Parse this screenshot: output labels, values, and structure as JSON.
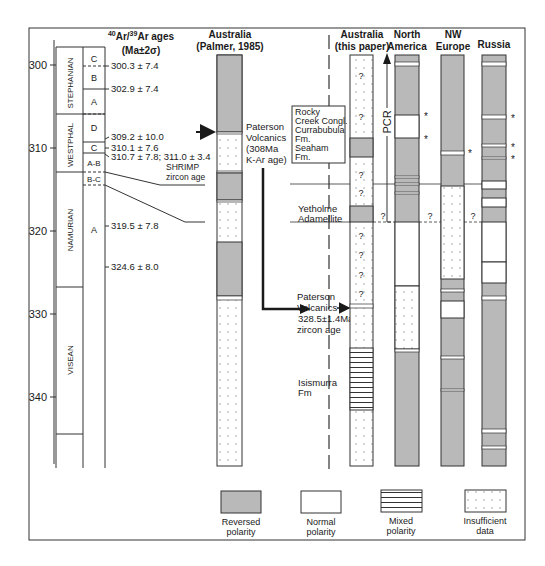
{
  "figure": {
    "colors": {
      "reversed": "#b9b9b9",
      "normal": "#ffffff",
      "line": "#2a2a2a",
      "dots": "#888888"
    },
    "scale": {
      "ticks": [
        {
          "label": "300",
          "age": 300
        },
        {
          "label": "310",
          "age": 310
        },
        {
          "label": "320",
          "age": 320
        },
        {
          "label": "330",
          "age": 330
        },
        {
          "label": "340",
          "age": 340
        }
      ]
    },
    "stratigraphy": {
      "stages": [
        {
          "label": "STEPHANIAN"
        },
        {
          "label": "WESTPHAL"
        },
        {
          "label": "NAMURIAN"
        },
        {
          "label": "VISEAN"
        }
      ],
      "substages": [
        "C",
        "B",
        "A",
        "D",
        "C",
        "A-B",
        "B-C",
        "A"
      ]
    },
    "ar_header": {
      "sup1": "40",
      "mid": "Ar/",
      "sup2": "39",
      "end": "Ar ages",
      "line2": "(Ma±2σ)"
    },
    "ar_ages": [
      "300.3 ± 7.4",
      "302.9 ± 7.4",
      "309.2 ± 10.0",
      "310.1 ± 7.6",
      "310.7 ± 7.8; 311.0 ± 3.4",
      "SHRIMP",
      "zircon age",
      "319.5 ± 7.8",
      "324.6 ± 8.0"
    ],
    "columns": [
      {
        "title1": "Australia",
        "title2": "(Palmer, 1985)"
      },
      {
        "title1": "Australia",
        "title2": "(this paper)"
      },
      {
        "title1": "North",
        "title2": "America"
      },
      {
        "title1": "NW",
        "title2": "Europe"
      },
      {
        "title1": "Russia",
        "title2": ""
      }
    ],
    "annotations": {
      "paterson_karar": [
        "Paterson",
        "Volcanics",
        "(308Ma",
        "K-Ar age)"
      ],
      "rocky_creek": [
        "Rocky",
        "Creek Congl.",
        "Currabubula",
        "Fm.",
        "Seaham",
        "Fm."
      ],
      "yetholme": [
        "Yetholme",
        "Adamellite"
      ],
      "paterson_zircon": [
        "Paterson",
        "Volcanics",
        "328.5±1.4Ma",
        "zircon age"
      ],
      "isismurra": [
        "Isismurra",
        "Fm"
      ],
      "pcr": "PCR",
      "question": "?",
      "star": "*"
    },
    "legend": [
      {
        "key": "reversed",
        "line1": "Reversed",
        "line2": "polarity"
      },
      {
        "key": "normal",
        "line1": "Normal",
        "line2": "polarity"
      },
      {
        "key": "mixed",
        "line1": "Mixed",
        "line2": "polarity"
      },
      {
        "key": "insufficient",
        "line1": "Insufficient",
        "line2": "data"
      }
    ]
  }
}
